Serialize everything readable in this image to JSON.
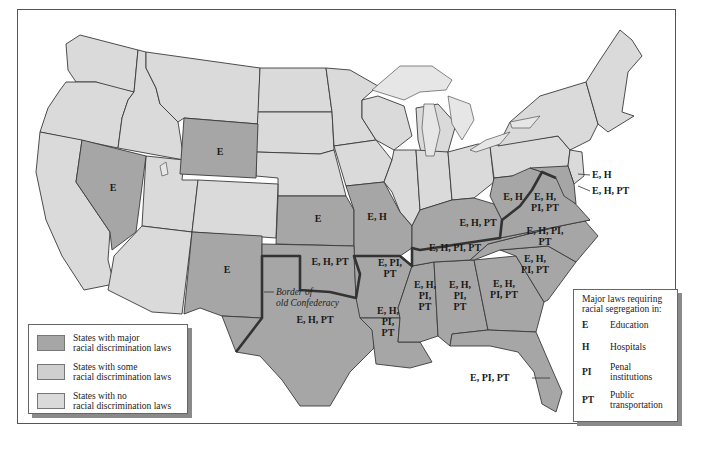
{
  "map": {
    "title": "Racial discrimination and segregation laws by state",
    "colors": {
      "major": "#a6a6a6",
      "some": "#cfcfcf",
      "none": "#dadada",
      "confederacy_border": "#333333"
    },
    "annotation": {
      "line1": "Border of",
      "line2": "old Confederacy"
    },
    "state_labels": {
      "nevada": "E",
      "wyoming": "E",
      "new_mexico": "E",
      "kansas": "E",
      "missouri": "E, H",
      "oklahoma": "E, H, PT",
      "texas": "E, H, PT",
      "arkansas": [
        "E, PI,",
        "PT"
      ],
      "louisiana": [
        "E, H,",
        "PI,",
        "PT"
      ],
      "mississippi": [
        "E, H,",
        "PI,",
        "PT"
      ],
      "alabama": [
        "E, H,",
        "PI,",
        "PT"
      ],
      "georgia": [
        "E, H,",
        "PI, PT"
      ],
      "south_carolina": [
        "E, H,",
        "PI, PT"
      ],
      "north_carolina": [
        "E, H, PI,",
        "PT"
      ],
      "tennessee": "E, H, PI, PT",
      "kentucky": "E, H, PT",
      "west_virginia": "E, H",
      "virginia": [
        "E, H,",
        "PI, PT"
      ],
      "delaware": "E, H",
      "maryland": "E, H, PT",
      "florida": "E, PI, PT"
    }
  },
  "legend_categories": {
    "items": [
      {
        "line1": "States with major",
        "line2": "racial discrimination laws",
        "swatch": "#a6a6a6"
      },
      {
        "line1": "States with some",
        "line2": "racial discrimination laws",
        "swatch": "#cfcfcf"
      },
      {
        "line1": "States with no",
        "line2": "racial discrimination laws",
        "swatch": "#dadada"
      }
    ]
  },
  "legend_laws": {
    "title_line1": "Major laws requiring",
    "title_line2": "racial segregation in:",
    "items": [
      {
        "code": "E",
        "line1": "Education",
        "line2": ""
      },
      {
        "code": "H",
        "line1": "Hospitals",
        "line2": ""
      },
      {
        "code": "PI",
        "line1": "Penal",
        "line2": "institutions"
      },
      {
        "code": "PT",
        "line1": "Public",
        "line2": "transportation"
      }
    ]
  }
}
